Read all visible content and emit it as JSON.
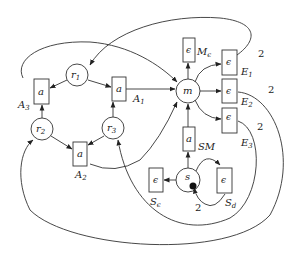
{
  "diagram": {
    "type": "petri-net",
    "places": [
      {
        "id": "r1",
        "label": "r",
        "sub": "1",
        "cx": 77,
        "cy": 75
      },
      {
        "id": "r2",
        "label": "r",
        "sub": "2",
        "cx": 42,
        "cy": 129
      },
      {
        "id": "r3",
        "label": "r",
        "sub": "3",
        "cx": 113,
        "cy": 128
      },
      {
        "id": "m",
        "label": "m",
        "sub": "",
        "cx": 188,
        "cy": 91
      },
      {
        "id": "s",
        "label": "s",
        "sub": "",
        "cx": 188,
        "cy": 180,
        "token": true
      }
    ],
    "transitions": [
      {
        "id": "A3",
        "inner": "a",
        "name": "A",
        "sub": "3"
      },
      {
        "id": "A1",
        "inner": "a",
        "name": "A",
        "sub": "1"
      },
      {
        "id": "A2",
        "inner": "a",
        "name": "A",
        "sub": "2"
      },
      {
        "id": "Me",
        "inner": "ϵ",
        "name": "M",
        "sub": "ϵ"
      },
      {
        "id": "E1",
        "inner": "ϵ",
        "name": "E",
        "sub": "1"
      },
      {
        "id": "E2",
        "inner": "ϵ",
        "name": "E",
        "sub": "2"
      },
      {
        "id": "E3",
        "inner": "ϵ",
        "name": "E",
        "sub": "3"
      },
      {
        "id": "SM",
        "inner": "a",
        "name": "SM",
        "sub": ""
      },
      {
        "id": "Se",
        "inner": "ϵ",
        "name": "S",
        "sub": "ϵ"
      },
      {
        "id": "Sd",
        "inner": "ϵ",
        "name": "S",
        "sub": "d"
      }
    ],
    "weights": {
      "E1_to_r1": "2",
      "E2_to_r2": "2",
      "E3_to_r3": "2",
      "Sd_to_s": "2"
    }
  }
}
